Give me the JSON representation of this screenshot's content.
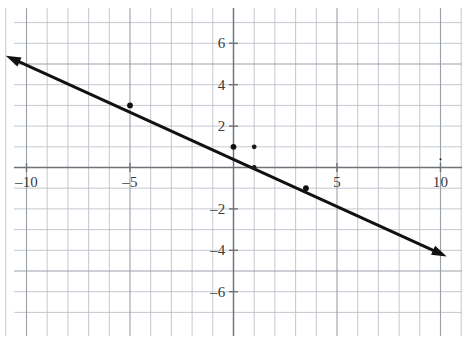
{
  "chart_data": {
    "type": "line",
    "title": "",
    "xlabel": "",
    "ylabel": "",
    "xlim": [
      -11.5,
      11.5
    ],
    "ylim": [
      -7.5,
      7.0
    ],
    "grid": true,
    "grid_step": 1,
    "legend": "none",
    "background_color": "#ffffff",
    "grid_color": "#b9bec6",
    "axis_color": "#6e7279",
    "line_color": "#111111",
    "x_ticks": [
      -10,
      -5,
      5,
      10
    ],
    "x_tick_labels": [
      "–10",
      "–5",
      "5",
      "10"
    ],
    "y_ticks": [
      6,
      4,
      2,
      -2,
      -4,
      -6
    ],
    "y_tick_labels": [
      "6",
      "4",
      "2",
      "–2",
      "–4",
      "–6"
    ],
    "series": [
      {
        "name": "line",
        "kind": "line-with-arrows",
        "equation_slope": -0.4,
        "equation_intercept": 1,
        "arrow_start": [
          -11,
          5.4
        ],
        "arrow_end": [
          10.3,
          -4.3
        ],
        "points": [
          {
            "x": -5,
            "y": 3
          },
          {
            "x": 0,
            "y": 1
          },
          {
            "x": 3.5,
            "y": -1
          }
        ]
      }
    ],
    "marked_points": [
      {
        "x": 0,
        "y": 1,
        "on_line": true
      },
      {
        "x": -5,
        "y": 3,
        "on_line": true
      },
      {
        "x": 3.5,
        "y": -1,
        "on_line": true
      },
      {
        "x": 1,
        "y": 1,
        "on_line": false
      },
      {
        "x": 1,
        "y": 0,
        "on_line": false
      },
      {
        "x": 10,
        "y": 0.4,
        "on_line": false
      }
    ]
  },
  "labels": {
    "x": [
      {
        "text": "–10",
        "value": -10
      },
      {
        "text": "–5",
        "value": -5
      },
      {
        "text": "5",
        "value": 5
      },
      {
        "text": "10",
        "value": 10
      }
    ],
    "y": [
      {
        "text": "6",
        "value": 6
      },
      {
        "text": "4",
        "value": 4
      },
      {
        "text": "2",
        "value": 2
      },
      {
        "text": "–2",
        "value": -2
      },
      {
        "text": "–4",
        "value": -4
      },
      {
        "text": "–6",
        "value": -6
      }
    ]
  }
}
